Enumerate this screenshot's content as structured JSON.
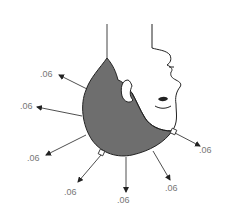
{
  "diagram": {
    "colors": {
      "hair_fill": "#6e6e6e",
      "outline": "#222222",
      "label": "#777777",
      "background": "#ffffff"
    },
    "labels": [
      {
        "text": ".06",
        "x": 40,
        "y": 69
      },
      {
        "text": ".06",
        "x": 20,
        "y": 101
      },
      {
        "text": ".06",
        "x": 27,
        "y": 153
      },
      {
        "text": ".06",
        "x": 64,
        "y": 187
      },
      {
        "text": ".06",
        "x": 117,
        "y": 195
      },
      {
        "text": ".06",
        "x": 165,
        "y": 183
      },
      {
        "text": ".06",
        "x": 199,
        "y": 145
      }
    ]
  }
}
